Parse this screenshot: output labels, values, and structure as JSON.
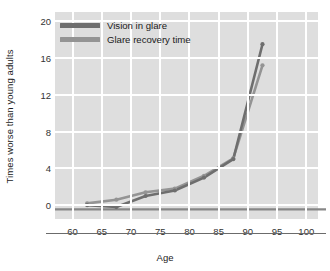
{
  "chart_data": {
    "type": "line",
    "title": "",
    "xlabel": "Age",
    "ylabel": "Times worse than young adults",
    "xlim": [
      57,
      102
    ],
    "ylim": [
      -1.5,
      21
    ],
    "xticks": [
      60,
      65,
      70,
      75,
      80,
      85,
      90,
      95,
      100
    ],
    "yticks": [
      0,
      4,
      8,
      12,
      16,
      20
    ],
    "grid": true,
    "legend_position": "upper-left-inside",
    "x": [
      62.5,
      67.5,
      72.5,
      77.5,
      82.5,
      87.5,
      92.5
    ],
    "series": [
      {
        "name": "Vision in glare",
        "color": "#6e6e6e",
        "values": [
          0.0,
          -0.2,
          1.0,
          1.6,
          3.0,
          5.0,
          17.5
        ]
      },
      {
        "name": "Glare recovery time",
        "color": "#949494",
        "values": [
          0.2,
          0.6,
          1.4,
          1.8,
          3.2,
          5.1,
          15.2
        ]
      }
    ],
    "reference_line": {
      "name": "baseline",
      "value": -0.45,
      "color": "#878787"
    }
  },
  "axes": {
    "y_title": "Times worse than young adults",
    "x_title": "Age",
    "y_tick_labels": [
      "0",
      "4",
      "8",
      "12",
      "16",
      "20"
    ],
    "x_tick_labels": [
      "60",
      "65",
      "70",
      "75",
      "80",
      "85",
      "90",
      "95",
      "100"
    ]
  },
  "legend": {
    "items": [
      {
        "label": "Vision in glare",
        "color": "#6e6e6e"
      },
      {
        "label": "Glare recovery time",
        "color": "#949494"
      }
    ]
  },
  "colors": {
    "plot_background": "#dedede",
    "page_background": "#ffffff",
    "gridline": "#ffffff",
    "axis_line": "#6b6b6b",
    "tick_text": "#333333",
    "title_text": "#1a1a1a"
  }
}
